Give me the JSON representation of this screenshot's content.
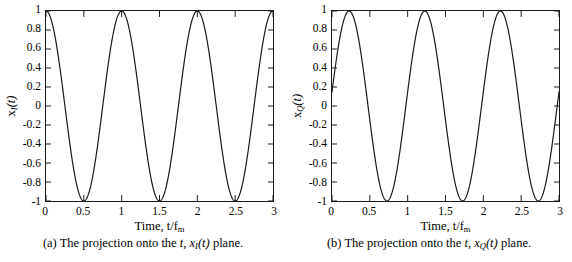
{
  "figure": {
    "background": "#ffffff",
    "line_color": "#1a1a1a",
    "axis_color": "#1a1a1a"
  },
  "panels": [
    {
      "id": "panel-a",
      "caption_prefix": "(a) The projection onto the ",
      "caption_math_t": "t",
      "caption_comma": ", ",
      "caption_var": "x",
      "caption_sub": "I",
      "caption_arg": "(t)",
      "caption_suffix": " plane.",
      "caption_full": "(a) The projection onto the t, x_I(t) plane.",
      "xlabel_text": "Time, t/f",
      "xlabel_sub": "m",
      "ylabel_var": "x",
      "ylabel_sub": "I",
      "ylabel_arg": "(t)",
      "ylabel_full": "x_I(t)",
      "yticks": [
        "1",
        "0.8",
        "0.6",
        "0.4",
        "0.2",
        "0",
        "-0.2",
        "-0.4",
        "-0.6",
        "-0.8",
        "-1"
      ],
      "ytick_values": [
        1,
        0.8,
        0.6,
        0.4,
        0.2,
        0,
        -0.2,
        -0.4,
        -0.6,
        -0.8,
        -1
      ],
      "xticks": [
        "0",
        "0.5",
        "1",
        "1.5",
        "2",
        "2.5",
        "3"
      ],
      "xtick_values": [
        0,
        0.5,
        1,
        1.5,
        2,
        2.5,
        3
      ]
    },
    {
      "id": "panel-b",
      "caption_prefix": "(b) The projection onto the ",
      "caption_math_t": "t",
      "caption_comma": ", ",
      "caption_var": "x",
      "caption_sub": "Q",
      "caption_arg": "(t)",
      "caption_suffix": " plane.",
      "caption_full": "(b) The projection onto the t, x_Q(t) plane.",
      "xlabel_text": "Time, t/f",
      "xlabel_sub": "m",
      "ylabel_var": "x",
      "ylabel_sub": "Q",
      "ylabel_arg": "(t)",
      "ylabel_full": "x_Q(t)",
      "yticks": [
        "1",
        "0.8",
        "0.6",
        "0.4",
        "0.2",
        "0",
        "-0.2",
        "-0.4",
        "-0.6",
        "-0.8",
        "-1"
      ],
      "ytick_values": [
        1,
        0.8,
        0.6,
        0.4,
        0.2,
        0,
        -0.2,
        -0.4,
        -0.6,
        -0.8,
        -1
      ],
      "xticks": [
        "0",
        "0.5",
        "1",
        "1.5",
        "2",
        "2.5",
        "3"
      ],
      "xtick_values": [
        0,
        0.5,
        1,
        1.5,
        2,
        2.5,
        3
      ]
    }
  ],
  "chart_data": [
    {
      "type": "line",
      "id": "panel-a",
      "title": "(a) The projection onto the t, x_I(t) plane.",
      "xlabel": "Time, t/f_m",
      "ylabel": "x_I(t)",
      "xlim": [
        0,
        3
      ],
      "ylim": [
        -1,
        1
      ],
      "grid": false,
      "legend": null,
      "xticks": [
        0,
        0.5,
        1,
        1.5,
        2,
        2.5,
        3
      ],
      "yticks": [
        -1,
        -0.8,
        -0.6,
        -0.4,
        -0.2,
        0,
        0.2,
        0.4,
        0.6,
        0.8,
        1
      ],
      "expression": "cos(2*pi*t)",
      "amplitude": 1,
      "frequency_cycles_per_unit": 1,
      "phase_radians": 0,
      "maxima_at_x": [
        0,
        1,
        2,
        3
      ],
      "minima_at_x": [
        0.5,
        1.5,
        2.5
      ],
      "zero_crossings_at_x": [
        0.25,
        0.75,
        1.25,
        1.75,
        2.25,
        2.75
      ],
      "x": [
        0,
        0.125,
        0.25,
        0.375,
        0.5,
        0.625,
        0.75,
        0.875,
        1,
        1.125,
        1.25,
        1.375,
        1.5,
        1.625,
        1.75,
        1.875,
        2,
        2.125,
        2.25,
        2.375,
        2.5,
        2.625,
        2.75,
        2.875,
        3
      ],
      "y": [
        1,
        0.707,
        0,
        -0.707,
        -1,
        -0.707,
        0,
        0.707,
        1,
        0.707,
        0,
        -0.707,
        -1,
        -0.707,
        0,
        0.707,
        1,
        0.707,
        0,
        -0.707,
        -1,
        -0.707,
        0,
        0.707,
        1
      ]
    },
    {
      "type": "line",
      "id": "panel-b",
      "title": "(b) The projection onto the t, x_Q(t) plane.",
      "xlabel": "Time, t/f_m",
      "ylabel": "x_Q(t)",
      "xlim": [
        0,
        3
      ],
      "ylim": [
        -1,
        1
      ],
      "grid": false,
      "legend": null,
      "xticks": [
        0,
        0.5,
        1,
        1.5,
        2,
        2.5,
        3
      ],
      "yticks": [
        -1,
        -0.8,
        -0.6,
        -0.4,
        -0.2,
        0,
        0.2,
        0.4,
        0.6,
        0.8,
        1
      ],
      "expression": "sin(2*pi*t + 0.15)",
      "amplitude": 1,
      "frequency_cycles_per_unit": 1,
      "phase_radians": 0.15,
      "maxima_at_x": [
        0.226,
        1.226,
        2.226
      ],
      "minima_at_x": [
        0.726,
        1.726,
        2.726
      ],
      "zero_crossings_at_x": [
        0.476,
        0.976,
        1.476,
        1.976,
        2.476,
        2.976
      ],
      "x": [
        0,
        0.125,
        0.25,
        0.375,
        0.5,
        0.625,
        0.75,
        0.875,
        1,
        1.125,
        1.25,
        1.375,
        1.5,
        1.625,
        1.75,
        1.875,
        2,
        2.125,
        2.25,
        2.375,
        2.5,
        2.625,
        2.75,
        2.875,
        3
      ],
      "y": [
        0.149,
        0.813,
        0.989,
        0.598,
        -0.149,
        -0.813,
        -0.989,
        -0.598,
        0.149,
        0.813,
        0.989,
        0.598,
        -0.149,
        -0.813,
        -0.989,
        -0.598,
        0.149,
        0.813,
        0.989,
        0.598,
        -0.149,
        -0.813,
        -0.989,
        -0.598,
        0.149
      ]
    }
  ]
}
